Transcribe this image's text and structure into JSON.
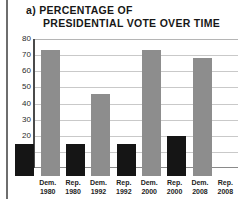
{
  "figure": {
    "label": "a)",
    "title_line_1": "a) PERCENTAGE OF",
    "title_line_2": "PRESIDENTIAL VOTE OVER TIME"
  },
  "colors": {
    "democrat_bar": "#151515",
    "republican_bar": "#8d8d8d",
    "gridline": "#c9c9c9",
    "axis": "#4a4a4a",
    "text": "#232323",
    "background": "#ffffff"
  },
  "chart_data": {
    "type": "bar",
    "title": "a) PERCENTAGE OF PRESIDENTIAL VOTE OVER TIME",
    "xlabel": "",
    "ylabel": "",
    "ylim": [
      0,
      80
    ],
    "yticks": [
      0,
      10,
      20,
      30,
      40,
      50,
      60,
      70,
      80
    ],
    "ytick_labels": [
      "",
      "10",
      "20",
      "30",
      "40",
      "50",
      "60",
      "70",
      "80"
    ],
    "grid": true,
    "legend": "none",
    "categories": [
      "Dem. 1980",
      "Rep. 1980",
      "Dem. 1992",
      "Rep. 1992",
      "Dem. 2000",
      "Rep. 2000",
      "Dem. 2008",
      "Rep. 2008"
    ],
    "category_parties": [
      "Dem.",
      "Rep.",
      "Dem.",
      "Rep.",
      "Dem.",
      "Rep.",
      "Dem.",
      "Rep."
    ],
    "category_years": [
      "1980",
      "1980",
      "1992",
      "1992",
      "2000",
      "2000",
      "2008",
      "2008"
    ],
    "values": [
      20,
      78,
      20,
      51,
      20,
      78,
      25,
      73
    ],
    "bar_colors": [
      "#151515",
      "#8d8d8d",
      "#151515",
      "#8d8d8d",
      "#151515",
      "#8d8d8d",
      "#151515",
      "#8d8d8d"
    ]
  }
}
